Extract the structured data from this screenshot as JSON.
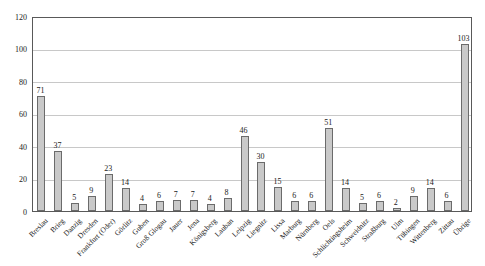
{
  "chart_data": {
    "type": "bar",
    "title": "",
    "xlabel": "",
    "ylabel": "",
    "categories": [
      "Breslau",
      "Brieg",
      "Danzig",
      "Dresden",
      "Frankfurt (Oder)",
      "Görlitz",
      "Guben",
      "Groß Glogau",
      "Jauer",
      "Jena",
      "Königsberg",
      "Lauban",
      "Leipzig",
      "Liegnitz",
      "Lissa",
      "Marburg",
      "Nürnberg",
      "Oels",
      "Schlichtingsheim",
      "Schweidnitz",
      "Straßburg",
      "Ulm",
      "Tübingen",
      "Wittenberg",
      "Zittau",
      "Übrige"
    ],
    "values": [
      71,
      37,
      5,
      9,
      23,
      14,
      4,
      6,
      7,
      7,
      4,
      8,
      46,
      30,
      15,
      6,
      6,
      51,
      14,
      5,
      6,
      2,
      9,
      14,
      6,
      103
    ],
    "yticks": [
      0,
      20,
      40,
      60,
      80,
      100,
      120
    ],
    "ylim": [
      0,
      120
    ],
    "grid": true,
    "legend": false,
    "data_labels": true,
    "colors": {
      "bar_fill": "#c9c9c9",
      "bar_border": "#6b6b6b",
      "gridline": "#c8c8c8",
      "plot_border": "#595959",
      "text": "#1a1a1a",
      "background": "#ffffff"
    }
  }
}
